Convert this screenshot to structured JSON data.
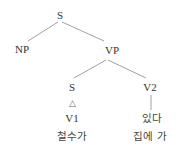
{
  "tree": {
    "nodes": {
      "root_s": "S",
      "np": "NP",
      "vp": "VP",
      "lower_s": "S",
      "v2": "V2",
      "triangle": "△",
      "v1": "V1",
      "v1_text": "철수가",
      "v2_word": "있다",
      "v2_text": "집에 가"
    },
    "edges": [
      [
        "S",
        "NP"
      ],
      [
        "S",
        "VP"
      ],
      [
        "VP",
        "S"
      ],
      [
        "VP",
        "V2"
      ],
      [
        "V2",
        "있다"
      ]
    ],
    "line_color": "#777777"
  }
}
